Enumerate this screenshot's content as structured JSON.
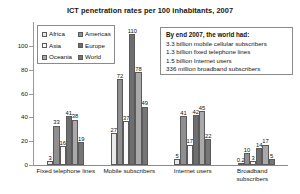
{
  "chart_data": {
    "type": "bar",
    "title": "ICT penetration rates per 100 inhabitants, 2007",
    "xlabel": "",
    "ylabel": "",
    "ylim": [
      0,
      120
    ],
    "grid": false,
    "legend_position": "upper-left-inside",
    "categories": [
      "Fixed telephone lines",
      "Mobile subscribers",
      "Internet users",
      "Broadband subscribers"
    ],
    "yticks": [
      0,
      20,
      40,
      60,
      80,
      100
    ],
    "series": [
      {
        "name": "Africa",
        "color": "#e9e9e9",
        "values": [
          3,
          27,
          5,
          0.2
        ],
        "labels": [
          "3",
          "27",
          "5",
          "0.2"
        ]
      },
      {
        "name": "Americas",
        "color": "#8f8f8f",
        "values": [
          33,
          72,
          41,
          10
        ],
        "labels": [
          "33",
          "72",
          "41",
          "10"
        ]
      },
      {
        "name": "Asia",
        "color": "#fafafa",
        "values": [
          16,
          37,
          17,
          3
        ],
        "labels": [
          "16",
          "37",
          "17",
          "3"
        ]
      },
      {
        "name": "Europe",
        "color": "#6e6e6e",
        "values": [
          41,
          110,
          42,
          14
        ],
        "labels": [
          "41",
          "110",
          "42",
          "14"
        ]
      },
      {
        "name": "Oceania",
        "color": "#a9a9a9",
        "values": [
          38,
          78,
          45,
          17
        ],
        "labels": [
          "38",
          "78",
          "45",
          "17"
        ]
      },
      {
        "name": "World",
        "color": "#767676",
        "values": [
          19,
          49,
          22,
          5
        ],
        "labels": [
          "19",
          "49",
          "22",
          "5"
        ]
      }
    ]
  },
  "legend": {
    "items": [
      {
        "label": "Africa"
      },
      {
        "label": "Americas"
      },
      {
        "label": "Asia"
      },
      {
        "label": "Europe"
      },
      {
        "label": "Oceania"
      },
      {
        "label": "World"
      }
    ]
  },
  "callout": {
    "heading": "By end 2007, the world had:",
    "lines": [
      "3.3 billion mobile cellular subscribers",
      "1.3 billion fixed telephone lines",
      "1.5 billion Internet users",
      "336 million broadband subscribers"
    ]
  }
}
